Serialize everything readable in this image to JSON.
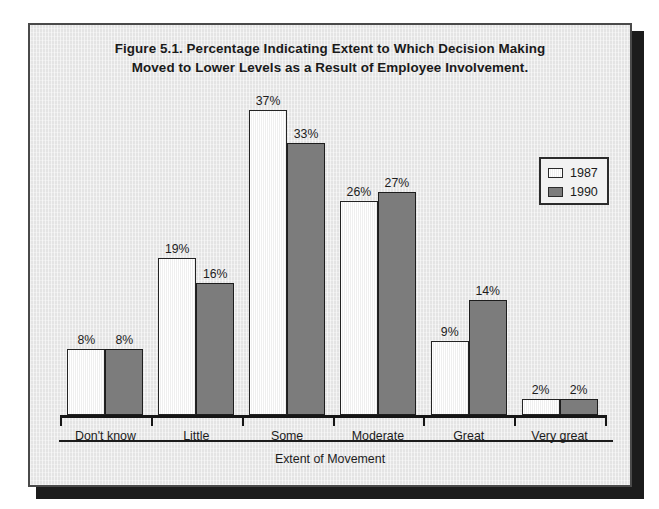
{
  "figure": {
    "title_line1": "Figure 5.1. Percentage Indicating Extent to Which Decision Making",
    "title_line2": "Moved to Lower Levels as a Result of Employee Involvement.",
    "axis_title": "Extent of Movement"
  },
  "legend": {
    "entries": [
      {
        "label": "1987",
        "swatch": "legend-swatch-1987",
        "color": "#ffffff"
      },
      {
        "label": "1990",
        "swatch": "legend-swatch-1990",
        "color": "#7c7c7c"
      }
    ]
  },
  "colors": {
    "series_1987": "#ffffff",
    "series_1990": "#7c7c7c",
    "outline": "#232323",
    "background": "#e4e4e4",
    "frame_border": "#4a4a4a",
    "text": "#1a1a1a"
  },
  "chart_data": {
    "type": "bar",
    "title": "Figure 5.1. Percentage Indicating Extent to Which Decision Making Moved to Lower Levels as a Result of Employee Involvement.",
    "xlabel": "Extent of Movement",
    "ylabel": "",
    "ylim": [
      0,
      40
    ],
    "grid": false,
    "legend_position": "top-right",
    "categories": [
      "Don't know",
      "Little",
      "Some",
      "Moderate",
      "Great",
      "Very great"
    ],
    "series": [
      {
        "name": "1987",
        "values": [
          8,
          19,
          37,
          26,
          9,
          2
        ],
        "labels": [
          "8%",
          "19%",
          "37%",
          "26%",
          "9%",
          "2%"
        ]
      },
      {
        "name": "1990",
        "values": [
          8,
          16,
          33,
          27,
          14,
          2
        ],
        "labels": [
          "8%",
          "16%",
          "33%",
          "27%",
          "14%",
          "2%"
        ]
      }
    ]
  }
}
